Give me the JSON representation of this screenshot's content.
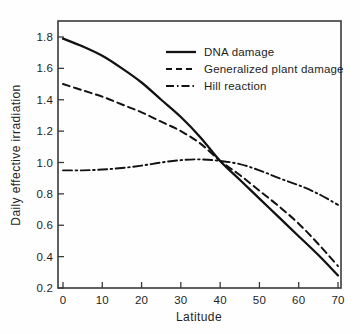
{
  "chart_data": {
    "type": "line",
    "title": "",
    "xlabel": "Latitude",
    "ylabel": "Daily effective irradiation",
    "xlim": [
      0,
      70
    ],
    "ylim": [
      0.2,
      1.8
    ],
    "xticks": [
      0,
      10,
      20,
      30,
      40,
      50,
      60,
      70
    ],
    "yticks": [
      0.2,
      0.4,
      0.6,
      0.8,
      1.0,
      1.2,
      1.4,
      1.6,
      1.8
    ],
    "xtick_labels": [
      "0",
      "10",
      "20",
      "30",
      "40",
      "50",
      "60",
      "70"
    ],
    "ytick_labels": [
      "0.2",
      "0.4",
      "0.6",
      "0.8",
      "1.0",
      "1.2",
      "1.4",
      "1.6",
      "1.8"
    ],
    "grid": false,
    "legend_position": "upper right",
    "x": [
      0,
      5,
      10,
      15,
      20,
      25,
      30,
      35,
      40,
      45,
      50,
      55,
      60,
      65,
      70
    ],
    "series": [
      {
        "name": "DNA damage",
        "style": "solid",
        "color": "#121212",
        "values": [
          1.79,
          1.74,
          1.68,
          1.6,
          1.51,
          1.4,
          1.29,
          1.16,
          1.01,
          0.89,
          0.77,
          0.65,
          0.53,
          0.41,
          0.28
        ]
      },
      {
        "name": "Generalized plant damage",
        "style": "dashed",
        "color": "#121212",
        "values": [
          1.5,
          1.46,
          1.42,
          1.37,
          1.32,
          1.26,
          1.2,
          1.12,
          1.01,
          0.92,
          0.82,
          0.72,
          0.61,
          0.48,
          0.34
        ]
      },
      {
        "name": "Hill reaction",
        "style": "dashdot",
        "color": "#121212",
        "values": [
          0.95,
          0.95,
          0.955,
          0.965,
          0.98,
          1.0,
          1.015,
          1.02,
          1.01,
          0.99,
          0.95,
          0.9,
          0.855,
          0.8,
          0.73
        ]
      }
    ]
  },
  "legend": {
    "items": [
      {
        "label": "DNA damage",
        "style": "solid"
      },
      {
        "label": "Generalized plant damage",
        "style": "dashed"
      },
      {
        "label": "Hill reaction",
        "style": "dashdot"
      }
    ]
  },
  "axes": {
    "x_title": "Latitude",
    "y_title": "Daily effective irradiation"
  }
}
